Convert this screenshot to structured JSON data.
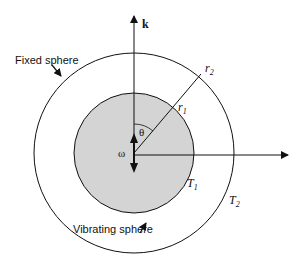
{
  "diagram": {
    "labels": {
      "fixed_sphere": "Fixed sphere",
      "vibrating_sphere": "Vibrating sphere",
      "k": "k",
      "theta": "θ",
      "omega": "ω",
      "r1": "r",
      "r1_sub": "1",
      "r2": "r",
      "r2_sub": "2",
      "T1": "T",
      "T1_sub": "1",
      "T2": "T",
      "T2_sub": "2"
    },
    "colors": {
      "inner_fill": "#d4d4d4",
      "stroke": "#111111"
    }
  }
}
